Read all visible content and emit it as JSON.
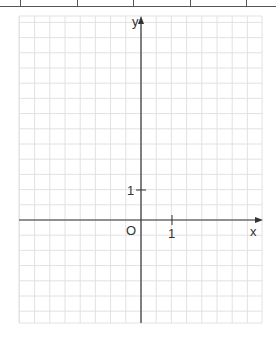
{
  "diagram": {
    "type": "cartesian-grid",
    "grid": {
      "left": 19,
      "top": 16,
      "right": 262,
      "bottom": 323,
      "cell_px": 15.2,
      "line_color": "#e2e2e2"
    },
    "origin_px": {
      "x": 141,
      "y": 220
    },
    "unit_cells": 2,
    "axes": {
      "x_label": "x",
      "y_label": "y",
      "origin_label": "O",
      "x_tick_label": "1",
      "y_tick_label": "1",
      "axis_color": "#333333"
    },
    "top_separator_ticks_px": [
      20,
      77,
      133,
      190,
      246
    ]
  }
}
